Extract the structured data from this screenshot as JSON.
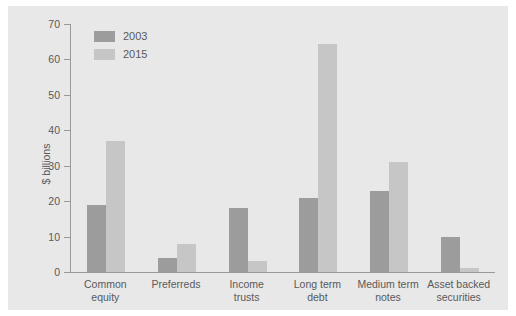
{
  "chart_data": {
    "type": "bar",
    "title": "",
    "xlabel": "",
    "ylabel": "$ billions",
    "ylim": [
      0,
      70
    ],
    "yticks": [
      0,
      10,
      20,
      30,
      40,
      50,
      60,
      70
    ],
    "grid": false,
    "legend_position": "top-left",
    "categories": [
      "Common equity",
      "Preferreds",
      "Income trusts",
      "Long term debt",
      "Medium term notes",
      "Asset backed securities"
    ],
    "category_lines": [
      [
        "Common",
        "equity"
      ],
      [
        "Preferreds",
        ""
      ],
      [
        "Income",
        "trusts"
      ],
      [
        "Long term",
        "debt"
      ],
      [
        "Medium term",
        "notes"
      ],
      [
        "Asset backed",
        "securities"
      ]
    ],
    "series": [
      {
        "name": "2003",
        "color": "#9c9c9c",
        "values": [
          19,
          4,
          18,
          21,
          23,
          10
        ]
      },
      {
        "name": "2015",
        "color": "#c6c6c6",
        "values": [
          37,
          8,
          3,
          64.5,
          31,
          1
        ]
      }
    ]
  },
  "legend": {
    "items": [
      {
        "label": "2003"
      },
      {
        "label": "2015"
      }
    ]
  },
  "colors": {
    "panel_background": "#e8e8e8",
    "page_background": "#ffffff",
    "axis": "#9a9a9a",
    "text": "#59595b",
    "series_2003": "#9c9c9c",
    "series_2015": "#c6c6c6"
  }
}
